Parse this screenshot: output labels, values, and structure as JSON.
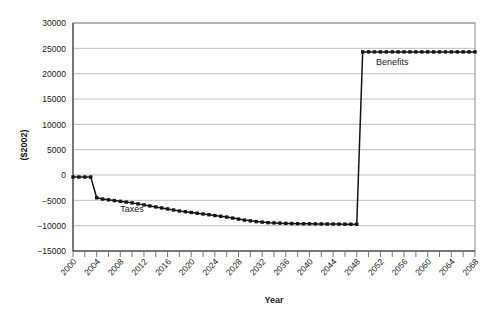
{
  "chart_data": {
    "type": "line",
    "title": "",
    "xlabel": "Year",
    "ylabel": "($2002)",
    "xlim": [
      2000,
      2068
    ],
    "ylim": [
      -15000,
      30000
    ],
    "grid": true,
    "legend_position": "inline-annotation",
    "ytick_labels": [
      "30000",
      "25000",
      "20000",
      "15000",
      "10000",
      "5000",
      "0",
      "-5000",
      "-10000",
      "-15000"
    ],
    "ytick_values": [
      30000,
      25000,
      20000,
      15000,
      10000,
      5000,
      0,
      -5000,
      -10000,
      -15000
    ],
    "xtick_labels": [
      "2000",
      "2004",
      "2008",
      "2012",
      "2016",
      "2020",
      "2024",
      "2028",
      "2032",
      "2036",
      "2040",
      "2044",
      "2048",
      "2052",
      "2056",
      "2060",
      "2064",
      "2068"
    ],
    "xtick_values": [
      2000,
      2004,
      2008,
      2012,
      2016,
      2020,
      2024,
      2028,
      2032,
      2036,
      2040,
      2044,
      2048,
      2052,
      2056,
      2060,
      2064,
      2068
    ],
    "x_minor_step": 2,
    "annotations": [
      {
        "text": "Taxes",
        "x": 2010,
        "y": -7300
      },
      {
        "text": "Benefits",
        "x": 2054,
        "y": 21800
      }
    ],
    "series": [
      {
        "name": "Taxes and Benefits",
        "color": "#151515",
        "marker": "square",
        "x": [
          2000,
          2001,
          2002,
          2003,
          2004,
          2005,
          2006,
          2007,
          2008,
          2009,
          2010,
          2011,
          2012,
          2013,
          2014,
          2015,
          2016,
          2017,
          2018,
          2019,
          2020,
          2021,
          2022,
          2023,
          2024,
          2025,
          2026,
          2027,
          2028,
          2029,
          2030,
          2031,
          2032,
          2033,
          2034,
          2035,
          2036,
          2037,
          2038,
          2039,
          2040,
          2041,
          2042,
          2043,
          2044,
          2045,
          2046,
          2047,
          2048,
          2049,
          2050,
          2051,
          2052,
          2053,
          2054,
          2055,
          2056,
          2057,
          2058,
          2059,
          2060,
          2061,
          2062,
          2063,
          2064,
          2065,
          2066,
          2067,
          2068
        ],
        "values": [
          -400,
          -400,
          -400,
          -400,
          -4500,
          -4750,
          -4900,
          -5050,
          -5200,
          -5350,
          -5500,
          -5700,
          -5900,
          -6100,
          -6300,
          -6500,
          -6700,
          -6900,
          -7100,
          -7250,
          -7400,
          -7550,
          -7700,
          -7850,
          -8000,
          -8150,
          -8300,
          -8500,
          -8700,
          -8900,
          -9050,
          -9200,
          -9300,
          -9400,
          -9450,
          -9500,
          -9550,
          -9580,
          -9600,
          -9620,
          -9640,
          -9650,
          -9660,
          -9670,
          -9680,
          -9690,
          -9700,
          -9710,
          -9720,
          24300,
          24300,
          24300,
          24300,
          24300,
          24300,
          24300,
          24300,
          24300,
          24300,
          24300,
          24300,
          24300,
          24300,
          24300,
          24300,
          24300,
          24300,
          24300,
          24300
        ]
      }
    ]
  }
}
